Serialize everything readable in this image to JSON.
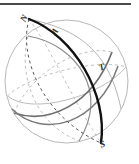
{
  "figure": {
    "name": "celestial-sphere-diagram",
    "type": "geometric-sphere-illustration",
    "background_color": "#ffffff",
    "width": 139,
    "height": 164
  },
  "top_rule": {
    "name": "top-divider-rule",
    "color": "#4a4a4a",
    "x": 0,
    "y": 3,
    "width": 131,
    "height": 2
  },
  "sphere": {
    "outline_name": "sphere-outline-circle",
    "center_x": 66.5,
    "center_y": 81.5,
    "radius": 61.5,
    "outline_color": "#b8b8b8",
    "outline_width": 1.0
  },
  "colors": {
    "bold_great_circle": "#111111",
    "gray_great_circle": "#6f6f6f",
    "light_gray_curve": "#a8a8a8",
    "dashed_dark": "#555555",
    "dashed_light": "#bdbdbd",
    "sphere_outline": "#b8b8b8",
    "label_text": "#2b2b2b",
    "top_rule": "#4a4a4a"
  },
  "labels": [
    {
      "id": "N",
      "text": "N",
      "x": 21,
      "y": 14,
      "rotation": -62,
      "meaning": "north-pole-point"
    },
    {
      "id": "A",
      "text": "A",
      "x": 52,
      "y": 27,
      "rotation": -48,
      "meaning": "point-a-on-meridian"
    },
    {
      "id": "T",
      "text": "T",
      "x": 99,
      "y": 63,
      "rotation": -20,
      "meaning": "point-t-on-gray-circle"
    },
    {
      "id": "S",
      "text": "S",
      "x": 100,
      "y": 140,
      "rotation": -18,
      "meaning": "south-pole-point"
    }
  ],
  "curves": [
    {
      "id": "bold-meridian-front",
      "style": "solid",
      "color": "#111111",
      "width": 2.4,
      "description": "bold great circle running from N at upper-left to S at lower-right (visible front arc)"
    },
    {
      "id": "bold-meridian-back",
      "style": "dashed",
      "color": "#555555",
      "width": 1.0,
      "description": "hidden rear half of the bold great circle, drawn dashed"
    },
    {
      "id": "gray-circle-1-front",
      "style": "solid",
      "color": "#6f6f6f",
      "width": 1.6,
      "description": "gray great circle tilted, front arc sweeping from left edge through lower middle to upper right near T"
    },
    {
      "id": "gray-circle-1-back",
      "style": "dashed",
      "color": "#bdbdbd",
      "width": 1.0,
      "description": "hidden rear arc of first gray great circle"
    },
    {
      "id": "gray-circle-2-front",
      "style": "solid",
      "color": "#6f6f6f",
      "width": 1.6,
      "description": "second gray great circle, front arc from lower-left rising to upper-right past T"
    },
    {
      "id": "gray-circle-2-back",
      "style": "dashed",
      "color": "#bdbdbd",
      "width": 1.0,
      "description": "hidden rear arc of second gray great circle"
    },
    {
      "id": "light-ellipse-front",
      "style": "solid",
      "color": "#a8a8a8",
      "width": 1.0,
      "description": "light gray ellipse (equator-like) front arc"
    },
    {
      "id": "light-ellipse-back",
      "style": "dashed",
      "color": "#bdbdbd",
      "width": 1.0,
      "description": "light gray ellipse hidden rear arc, dashed"
    },
    {
      "id": "light-meridian",
      "style": "solid",
      "color": "#b0b0b0",
      "width": 1.0,
      "description": "light gray meridian arc through the upper region of the sphere"
    }
  ]
}
